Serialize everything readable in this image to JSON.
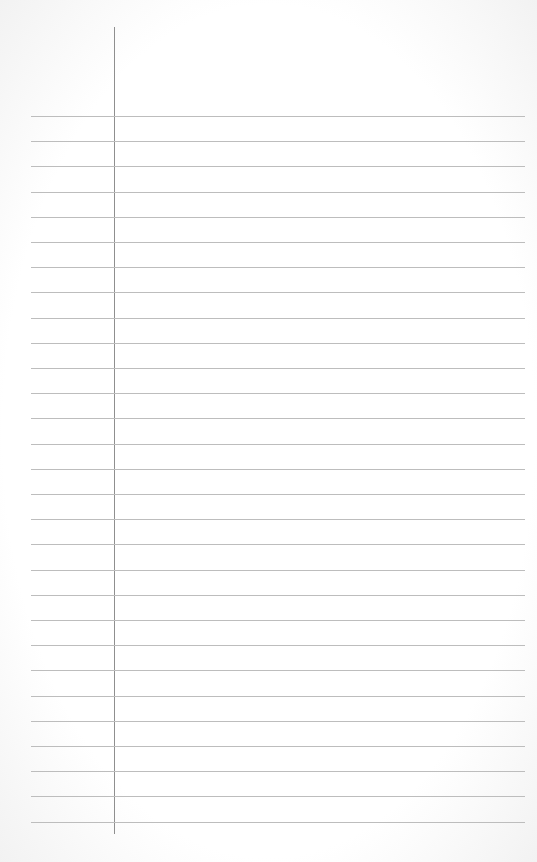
{
  "page": {
    "type": "blank-ruled-paper",
    "rule_count": 29,
    "rule_start_y": 116,
    "rule_spacing": 25.2,
    "colors": {
      "paper": "#ffffff",
      "rule": "#bdbdbd",
      "margin": "#8f8f8f"
    }
  }
}
